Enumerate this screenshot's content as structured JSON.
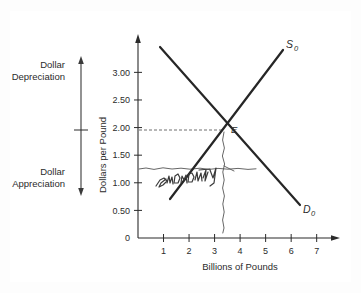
{
  "figure": {
    "kind": "supply-demand-diagram",
    "side_labels": {
      "top": "Dollar\nDepreciation",
      "top_line1": "Dollar",
      "top_line2": "Depreciation",
      "bottom_line1": "Dollar",
      "bottom_line2": "Appreciation"
    },
    "annotation": {
      "handwritten_text": "shortage",
      "handwritten_style": "pencil-scribble"
    }
  },
  "chart_data": {
    "type": "line",
    "title": "",
    "xlabel": "Billions of Pounds",
    "ylabel": "Dollars per Pound",
    "xlim": [
      0,
      7.6
    ],
    "ylim": [
      0,
      3.55
    ],
    "xticks": [
      1,
      2,
      3,
      4,
      5,
      6,
      7
    ],
    "xtick_labels": [
      "1",
      "2",
      "3",
      "4",
      "5",
      "6",
      "7"
    ],
    "yticks": [
      0,
      0.5,
      1.0,
      1.5,
      2.0,
      2.5,
      3.0
    ],
    "ytick_labels": [
      "0",
      "0.50",
      "1.00",
      "1.50",
      "2.00",
      "2.50",
      "3.00"
    ],
    "grid": false,
    "legend": "inline-curve-labels",
    "series": [
      {
        "name": "S0",
        "label": "S",
        "subscript": "0",
        "role": "supply",
        "x": [
          1.05,
          5.4
        ],
        "values": [
          0.72,
          3.08
        ],
        "label_position": [
          5.55,
          3.3
        ]
      },
      {
        "name": "D0",
        "label": "D",
        "subscript": "0",
        "role": "demand",
        "x": [
          0.82,
          6.1
        ],
        "values": [
          3.28,
          0.62
        ],
        "label_position": [
          6.2,
          0.55
        ]
      }
    ],
    "equilibrium": {
      "label": "E",
      "x": 3.0,
      "y": 2.0
    },
    "annotations": [
      {
        "kind": "guide-line",
        "orientation": "horizontal",
        "y": 2.0,
        "x_from": 0.0,
        "x_to": 3.0,
        "style": "dashed"
      },
      {
        "kind": "guide-line",
        "orientation": "horizontal",
        "y": 1.25,
        "x_from": 0.0,
        "x_to": 4.35,
        "style": "hand-dashed"
      },
      {
        "kind": "guide-line",
        "orientation": "vertical",
        "x": 3.0,
        "y_from": 0.08,
        "y_to": 2.0,
        "style": "hand-dashed"
      },
      {
        "kind": "handwritten-note",
        "text": "shortage",
        "x": 1.55,
        "y": 1.1
      }
    ],
    "range_markers": [
      {
        "label_line1": "Dollar",
        "label_line2": "Depreciation",
        "direction": "up",
        "region": "above-equilibrium"
      },
      {
        "label_line1": "Dollar",
        "label_line2": "Appreciation",
        "direction": "down",
        "region": "below-equilibrium"
      }
    ]
  }
}
